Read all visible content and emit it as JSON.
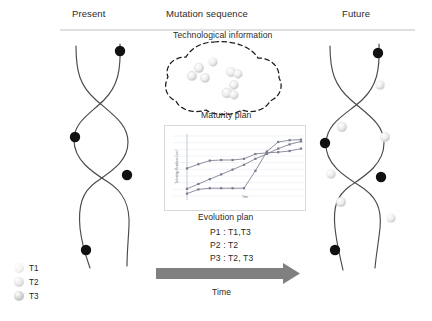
{
  "headers": {
    "present": "Present",
    "mutation": "Mutation sequence",
    "future": "Future"
  },
  "labels": {
    "technological_information": "Technological information",
    "maturity_plan": "Maturity plan",
    "evolution_plan": "Evolution plan",
    "time": "Time"
  },
  "evolution_plan": {
    "lines": [
      "P1 : T1,T3",
      "P2 : T2",
      "P3 : T2, T3"
    ]
  },
  "legend": {
    "items": [
      {
        "label": "T1",
        "color": "#f2f2f2"
      },
      {
        "label": "T2",
        "color": "#e0e0e0"
      },
      {
        "label": "T3",
        "color": "#c9c9c9"
      }
    ]
  },
  "colors": {
    "strand": "#4a4a4a",
    "node_black": "#111111",
    "arrow": "#808080",
    "rule": "#bfbfbf",
    "cloud_dash": "#1a1a1a",
    "chart_border": "#d9d9d9",
    "chart_grid": "#dfe6ef",
    "chart_series": "#7b7b8f"
  },
  "chart_data": {
    "type": "line",
    "title": "Maturity plan",
    "xlabel": "Time",
    "ylabel": "Technology Readiness Level",
    "grid": true,
    "legend_position": "none",
    "xlim": [
      0,
      10
    ],
    "ylim": [
      0,
      10
    ],
    "x": [
      0,
      1,
      2,
      3,
      4,
      5,
      6,
      7,
      8,
      9,
      10
    ],
    "series": [
      {
        "name": "T1",
        "values": [
          4.6,
          5.3,
          5.9,
          6.0,
          6.0,
          6.2,
          7.0,
          7.2,
          7.3,
          7.5,
          7.9
        ]
      },
      {
        "name": "T2",
        "values": [
          1.2,
          2.0,
          2.8,
          3.6,
          4.4,
          5.2,
          6.2,
          7.0,
          7.9,
          8.6,
          9.1
        ]
      },
      {
        "name": "T3",
        "values": [
          0.4,
          1.1,
          1.3,
          1.3,
          1.3,
          1.3,
          4.2,
          7.4,
          9.0,
          9.3,
          9.4
        ]
      }
    ]
  },
  "cloud": {
    "spheres": [
      {
        "cx": 213,
        "cy": 62,
        "r": 4.6,
        "shade": "#f4f4f4"
      },
      {
        "cx": 199,
        "cy": 68,
        "r": 4.8,
        "shade": "#dcdcdc"
      },
      {
        "cx": 205,
        "cy": 78,
        "r": 4.6,
        "shade": "#dcdcdc"
      },
      {
        "cx": 192,
        "cy": 76,
        "r": 4.6,
        "shade": "#d2d2d2"
      },
      {
        "cx": 231,
        "cy": 72,
        "r": 5.0,
        "shade": "#efefef"
      },
      {
        "cx": 238,
        "cy": 74,
        "r": 4.4,
        "shade": "#e8e8e8"
      },
      {
        "cx": 234,
        "cy": 85,
        "r": 4.4,
        "shade": "#dadada"
      },
      {
        "cx": 227,
        "cy": 93,
        "r": 5.0,
        "shade": "#d6d6d6"
      },
      {
        "cx": 234,
        "cy": 95,
        "r": 4.4,
        "shade": "#e6e6e6"
      }
    ]
  },
  "present_strand": {
    "nodes": [
      {
        "cx": 120,
        "cy": 51,
        "kind": "black"
      },
      {
        "cx": 75,
        "cy": 137,
        "kind": "black"
      },
      {
        "cx": 127,
        "cy": 175,
        "kind": "black"
      },
      {
        "cx": 86,
        "cy": 250,
        "kind": "black"
      }
    ]
  },
  "future_strand": {
    "nodes": [
      {
        "cx": 378,
        "cy": 53,
        "kind": "black"
      },
      {
        "cx": 380,
        "cy": 85,
        "kind": "sphere",
        "shade": "#f0f0f0"
      },
      {
        "cx": 342,
        "cy": 127,
        "kind": "sphere",
        "shade": "#dcdcdc"
      },
      {
        "cx": 325,
        "cy": 143,
        "kind": "black"
      },
      {
        "cx": 385,
        "cy": 137,
        "kind": "sphere",
        "shade": "#e3e3e3"
      },
      {
        "cx": 331,
        "cy": 174,
        "kind": "sphere",
        "shade": "#f4f4f4"
      },
      {
        "cx": 381,
        "cy": 177,
        "kind": "black"
      },
      {
        "cx": 341,
        "cy": 202,
        "kind": "sphere",
        "shade": "#dedede"
      },
      {
        "cx": 391,
        "cy": 218,
        "kind": "sphere",
        "shade": "#fafafa"
      },
      {
        "cx": 335,
        "cy": 250,
        "kind": "black"
      }
    ]
  }
}
